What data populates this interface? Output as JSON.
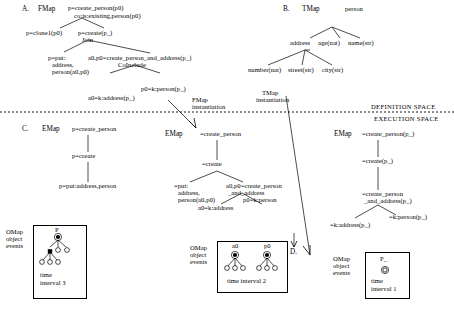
{
  "spaces": {
    "definition": "DEFINITION SPACE",
    "execution": "EXECUTION SPACE"
  },
  "sections": {
    "a": {
      "letter": "A.",
      "map_label": "FMap",
      "nodes": {
        "root_line1": "p=create_person(p0)",
        "root_line2": "co:is:existing,person(p0)",
        "left": "p=clone1(p0)",
        "right_line1": "p=create(p_)",
        "right_line2": "Join",
        "put_line1": "p=put:",
        "put_line2": "address,",
        "put_line3": "person(a0,p0)",
        "cpa_line1": "a0,p0=create_person_and_address(p_)",
        "cpa_line2": "CoInclude",
        "addr": "a0=k:address(p_)",
        "pers": "p0=k:person(p_)"
      },
      "instantiation_line1": "FMap",
      "instantiation_line2": "instantiation"
    },
    "b": {
      "letter": "B.",
      "map_label": "TMap",
      "nodes": {
        "root": "person",
        "address": "address",
        "age": "age(nat)",
        "name": "name(str)",
        "number": "number(nat)",
        "street": "street(str)",
        "city": "city(str)"
      },
      "instantiation_line1": "TMap",
      "instantiation_line2": "instantiation"
    },
    "c": {
      "letter": "C.",
      "map_label": "EMap",
      "nodes": {
        "root": "p=create_person",
        "mid": "p=create",
        "leaf": "p=put:address,person"
      }
    },
    "emap_mid": {
      "map_label": "EMap",
      "nodes": {
        "root": "=create_person",
        "mid": "=create",
        "put_line1": "=put:",
        "put_line2": "address,",
        "put_line3": "person(a0,p0)",
        "cpa_line1": "a0,p0=create_person",
        "cpa_line2": "_and_address",
        "addr": "a0=k:address",
        "pers": "p0=k:person"
      }
    },
    "emap_right": {
      "map_label": "EMap",
      "nodes": {
        "root": "=create_person(p_)",
        "mid": "=create(p_)",
        "cpa_line1": "=create_person",
        "cpa_line2": "_and_address(p_)",
        "addr": "=k:address(p_)",
        "pers": "=k:person(p_)"
      }
    },
    "d": {
      "letter": "D."
    }
  },
  "omaps": [
    {
      "label_line1": "OMap",
      "label_line2": "object",
      "label_line3": "events",
      "root_label": "P",
      "interval_line1": "time",
      "interval_line2": "interval 3"
    },
    {
      "label_line1": "OMap",
      "label_line2": "object",
      "label_line3": "events",
      "root_label_a": "a0",
      "root_label_b": "p0",
      "interval": "time interval 2"
    },
    {
      "label_line1": "OMap",
      "label_line2": "object",
      "label_line3": "events",
      "root_label": "P_",
      "interval_line1": "time",
      "interval_line2": "interval 1"
    }
  ]
}
